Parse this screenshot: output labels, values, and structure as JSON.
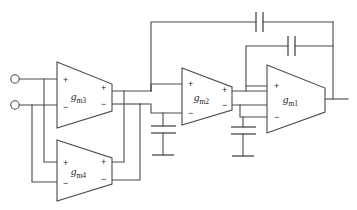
{
  "diagram": {
    "type": "circuit-schematic",
    "stroke_color": "#4a4a4a",
    "background_color": "#ffffff"
  },
  "amplifiers": [
    {
      "id": "gm3",
      "label_base": "g",
      "label_sub": "m3",
      "in_plus": "+",
      "in_minus": "−",
      "out_plus": "+",
      "out_minus": "−"
    },
    {
      "id": "gm4",
      "label_base": "g",
      "label_sub": "m4",
      "in_plus": "+",
      "in_minus": "−",
      "out_plus": "+",
      "out_minus": "−"
    },
    {
      "id": "gm2",
      "label_base": "g",
      "label_sub": "m2",
      "in_plus": "+",
      "in_minus": "−",
      "out_plus": "+",
      "out_minus": "−"
    },
    {
      "id": "gm1",
      "label_base": "g",
      "label_sub": "m1",
      "in_plus": "+",
      "in_minus": "−",
      "out_plus": "",
      "out_minus": ""
    }
  ],
  "terminals": [
    {
      "id": "input-positive",
      "shape": "open-circle"
    },
    {
      "id": "input-negative",
      "shape": "open-circle"
    }
  ],
  "capacitors": [
    {
      "id": "outer-miller-cap",
      "orientation": "vertical-plates"
    },
    {
      "id": "inner-miller-cap",
      "orientation": "vertical-plates"
    },
    {
      "id": "load-cap-stage2",
      "orientation": "horizontal-plates",
      "grounded": "true"
    },
    {
      "id": "load-cap-stage1",
      "orientation": "horizontal-plates",
      "grounded": "true"
    }
  ],
  "grounds": [
    {
      "id": "ground-stage2"
    },
    {
      "id": "ground-stage1"
    }
  ],
  "nets": [
    {
      "id": "input-bus"
    },
    {
      "id": "gm3-output-bus"
    },
    {
      "id": "gm2-output-bus"
    },
    {
      "id": "output-node"
    }
  ]
}
